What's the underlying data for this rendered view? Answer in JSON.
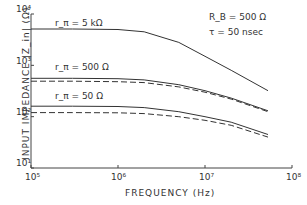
{
  "chart_data": {
    "type": "line",
    "title": "",
    "xlabel": "FREQUENCY  (Hz)",
    "ylabel": "INPUT IMPEDANCE |Z_in| (Ω)",
    "xscale": "log",
    "yscale": "log",
    "xlim": [
      100000,
      100000000
    ],
    "ylim": [
      10,
      10000
    ],
    "x_ticks": [
      "10^5",
      "10^6",
      "10^7",
      "10^8"
    ],
    "y_ticks": [
      "10^1",
      "10^2",
      "10^3",
      "10^4"
    ],
    "grid": false,
    "annotations": [
      "R_B = 500 Ω",
      "τ = 50 nsec"
    ],
    "x": [
      100000,
      300000,
      1000000,
      2000000,
      5000000,
      10000000,
      20000000,
      53000000
    ],
    "series": [
      {
        "name": "r_π = 5 kΩ",
        "style": "solid",
        "values": [
          5100,
          5100,
          5000,
          4500,
          2800,
          1500,
          800,
          320
        ]
      },
      {
        "name": "r_π = 500 Ω",
        "style": "solid",
        "values": [
          560,
          560,
          550,
          520,
          420,
          320,
          230,
          130
        ]
      },
      {
        "name": "r_π = 500 Ω (dashed)",
        "style": "dashed",
        "values": [
          490,
          490,
          480,
          460,
          380,
          300,
          220,
          125
        ]
      },
      {
        "name": "r_π = 50 Ω",
        "style": "solid",
        "values": [
          160,
          160,
          158,
          150,
          125,
          100,
          78,
          45
        ]
      },
      {
        "name": "r_π = 50 Ω (dashed)",
        "style": "dashed",
        "values": [
          120,
          120,
          119,
          115,
          100,
          85,
          68,
          40
        ]
      }
    ]
  },
  "labels": {
    "y_title": "INPUT  IMPEDANCE  |Z_in|  (Ω)",
    "x_title": "FREQUENCY    (Hz)",
    "rb": "R_B = 500 Ω",
    "tau": "τ  = 50 nsec",
    "curve1": "r_π = 5 kΩ",
    "curve2": "r_π = 500 Ω",
    "curve3": "r_π = 50 Ω",
    "x_ticks": [
      "10⁵",
      "10⁶",
      "10⁷",
      "10⁸"
    ],
    "y_ticks": [
      "10⁴",
      "10³",
      "10²",
      "10¹"
    ]
  }
}
